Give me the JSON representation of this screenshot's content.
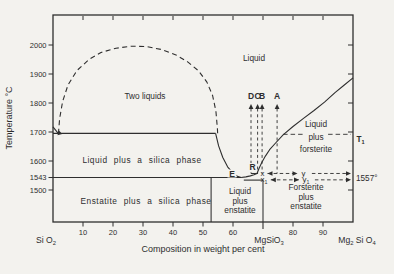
{
  "page": {
    "bg": "#f3f2ee",
    "ink": "#2e2e2e"
  },
  "chart_data": {
    "type": "line",
    "xlabel": "Composition in weight per cent",
    "ylabel": "Temperature °C",
    "x_axis": {
      "xlim": [
        0,
        100
      ],
      "bottom_ticks": [
        10,
        20,
        30,
        40,
        50,
        60,
        80,
        90
      ],
      "top_ticks": [
        10,
        20,
        30,
        40,
        50,
        60,
        70,
        80,
        90
      ],
      "marker_tick_w": 70,
      "end_labels": [
        {
          "name": "label-sio2",
          "x_px": 46,
          "y_px": 243,
          "parts": [
            [
              "Si O",
              false
            ],
            [
              "2",
              true
            ]
          ]
        },
        {
          "name": "label-mgsio3",
          "x_px": 269,
          "y_px": 243,
          "parts": [
            [
              "MgSiO",
              false
            ],
            [
              "3",
              true
            ]
          ]
        },
        {
          "name": "label-mg2sio4",
          "x_px": 357,
          "y_px": 243,
          "parts": [
            [
              "Mg",
              false
            ],
            [
              "2",
              true
            ],
            [
              " Si O",
              false
            ],
            [
              "4",
              true
            ]
          ]
        }
      ],
      "title_px": [
        203,
        252
      ]
    },
    "y_axis": {
      "left_ticks": [
        2000,
        1900,
        1800,
        1700,
        1600,
        1543,
        1500
      ],
      "right_ticks": [
        2000,
        1900,
        1800,
        1700,
        1600,
        1500
      ],
      "title_px": [
        12,
        118
      ]
    },
    "series": [
      {
        "name": "two-liquids-solvus-dome",
        "style": "dashed",
        "arrow_start": true,
        "points": [
          [
            1.8,
            1694
          ],
          [
            2.2,
            1745
          ],
          [
            3.2,
            1805
          ],
          [
            5,
            1862
          ],
          [
            8,
            1912
          ],
          [
            12,
            1950
          ],
          [
            16,
            1974
          ],
          [
            21,
            1989
          ],
          [
            26,
            1996
          ],
          [
            31,
            1995
          ],
          [
            36,
            1985
          ],
          [
            41,
            1966
          ],
          [
            45,
            1941
          ],
          [
            48.5,
            1911
          ],
          [
            51.3,
            1872
          ],
          [
            53.2,
            1826
          ],
          [
            54.3,
            1772
          ],
          [
            54.8,
            1712
          ],
          [
            54.9,
            1692
          ]
        ]
      },
      {
        "name": "cristobalite-liquidus-stub",
        "style": "solid",
        "points": [
          [
            0,
            1718
          ],
          [
            1.8,
            1694
          ]
        ]
      },
      {
        "name": "monotectic-line-1695",
        "style": "solid",
        "points": [
          [
            0,
            1695
          ],
          [
            54.2,
            1695
          ]
        ]
      },
      {
        "name": "silica-liquidus-to-eutectic",
        "style": "solid",
        "points": [
          [
            54.2,
            1695
          ],
          [
            55.2,
            1652
          ],
          [
            56.6,
            1612
          ],
          [
            58.2,
            1580
          ],
          [
            60,
            1558
          ],
          [
            61.5,
            1547
          ],
          [
            62.7,
            1543
          ]
        ]
      },
      {
        "name": "eutectic-line-1543",
        "style": "solid",
        "points": [
          [
            0,
            1543
          ],
          [
            62.7,
            1543
          ]
        ]
      },
      {
        "name": "enstatite-solidus-segment",
        "style": "solid",
        "points": [
          [
            63.6,
            1534
          ],
          [
            70,
            1534
          ]
        ]
      },
      {
        "name": "enstatite-liquidus-E-to-R",
        "style": "solid",
        "points": [
          [
            62.7,
            1543
          ],
          [
            64.3,
            1545
          ],
          [
            65.8,
            1548.5
          ],
          [
            67,
            1552.5
          ],
          [
            68,
            1557
          ]
        ]
      },
      {
        "name": "forsterite-liquidus",
        "style": "solid",
        "points": [
          [
            68,
            1557
          ],
          [
            68.7,
            1575
          ],
          [
            69.6,
            1595
          ],
          [
            70.8,
            1617
          ],
          [
            72.2,
            1639
          ],
          [
            74.2,
            1662
          ],
          [
            76.7,
            1690
          ],
          [
            80,
            1719
          ],
          [
            83.5,
            1747
          ],
          [
            87,
            1774
          ],
          [
            90.5,
            1803
          ],
          [
            94,
            1836
          ],
          [
            97,
            1861
          ],
          [
            100,
            1887
          ]
        ]
      }
    ],
    "t1_line": {
      "name": "t1-dashed-line",
      "T": 1692,
      "from_w": 76.7,
      "to_w": 100
    },
    "tie_lines": [
      {
        "name": "tie-line-x-y",
        "T": 1557,
        "stub_w": [
          66,
          68.3
        ],
        "labels": [
          {
            "parts": [
              [
                "x",
                false
              ]
            ],
            "w": 69.8
          },
          {
            "parts": [
              [
                "y",
                false
              ]
            ],
            "w": 83.5
          }
        ],
        "double_arrow_w": [
          71.5,
          81.5
        ],
        "tail_w": [
          86.3,
          98.6
        ]
      },
      {
        "name": "tie-line-x1-y1",
        "T": 1535,
        "stub_w": null,
        "labels": [
          {
            "parts": [
              [
                "x",
                false
              ],
              [
                "1",
                true
              ]
            ],
            "w": 70.3
          },
          {
            "parts": [
              [
                "y",
                false
              ],
              [
                "1",
                true
              ]
            ],
            "w": 84.3
          }
        ],
        "double_arrow_w": [
          72.6,
          82
        ],
        "tail_w": [
          87.3,
          98.6
        ]
      }
    ],
    "composition_markers": {
      "labels": [
        "D",
        "C",
        "B",
        "A"
      ],
      "w": [
        66,
        68.2,
        69.7,
        74.7
      ],
      "T_bottom": 1557,
      "top_px": 104,
      "label_baseline_px": 99
    },
    "boundary_verticals": [
      {
        "name": "liquid-plus-enstatite-left-boundary",
        "w": 52.7,
        "top_T": 1543
      },
      {
        "name": "mgsio3-composition-line",
        "w": 70,
        "top_T": 1535
      }
    ],
    "point_labels": [
      {
        "name": "point-E",
        "text": "E",
        "px": [
          232,
          176.5
        ]
      },
      {
        "name": "point-R",
        "text": "R",
        "px": [
          252.5,
          170
        ]
      }
    ],
    "right_side_labels": [
      {
        "name": "label-T1",
        "parts": [
          [
            "T",
            false
          ],
          [
            "1",
            true
          ]
        ],
        "px": [
          356.5,
          141.5
        ],
        "bold": true
      },
      {
        "name": "label-1557",
        "parts": [
          [
            "1557°",
            false
          ]
        ],
        "px": [
          356,
          180.5
        ],
        "bold": false
      }
    ],
    "region_labels": [
      {
        "name": "region-liquid",
        "lines": [
          "Liquid"
        ],
        "px": [
          254,
          61
        ]
      },
      {
        "name": "region-two-liquids",
        "lines": [
          "Two liquids"
        ],
        "px": [
          145,
          99
        ]
      },
      {
        "name": "region-liquid-plus-silica",
        "lines": [
          "Liquid plus a silica phase"
        ],
        "px": [
          142,
          163
        ],
        "spread": true
      },
      {
        "name": "region-enstatite-plus-silica",
        "lines": [
          "Enstatite plus a silica phase"
        ],
        "px": [
          146,
          204
        ],
        "spread": true
      },
      {
        "name": "region-liquid-plus-enstatite",
        "lines": [
          "Liquid",
          "plus",
          "enstatite"
        ],
        "px": [
          240,
          194
        ],
        "lh": 9.5
      },
      {
        "name": "region-forsterite-plus-enstatite",
        "lines": [
          "Forsterite",
          "plus",
          "enstatite"
        ],
        "px": [
          306,
          190
        ],
        "lh": 9.5
      },
      {
        "name": "region-liquid-plus-forsterite",
        "lines": [
          "Liquid",
          "plus",
          "forsterite"
        ],
        "px": [
          316,
          127
        ],
        "lh": 12.5,
        "mask_line": 1
      }
    ]
  }
}
